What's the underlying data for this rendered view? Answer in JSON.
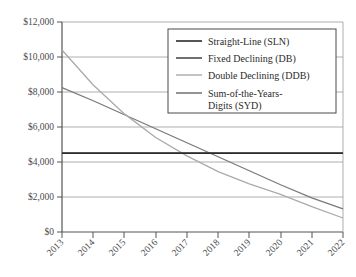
{
  "chart_data": {
    "type": "line",
    "title": "",
    "xlabel": "",
    "ylabel": "",
    "grid": true,
    "legend_position": "top-right",
    "x": [
      2013,
      2014,
      2015,
      2016,
      2017,
      2018,
      2019,
      2020,
      2021,
      2022
    ],
    "categories": [
      "2013",
      "2014",
      "2015",
      "2016",
      "2017",
      "2018",
      "2019",
      "2020",
      "2021",
      "2022"
    ],
    "ylim": [
      0,
      12000
    ],
    "ytick_values": [
      0,
      2000,
      4000,
      6000,
      8000,
      10000,
      12000
    ],
    "ytick_labels": [
      "$0",
      "$2,000",
      "$4,000",
      "$6,000",
      "$8,000",
      "$10,000",
      "$12,000"
    ],
    "series": [
      {
        "name": "Straight-Line (SLN)",
        "color": "#2b2b2b",
        "values": [
          4500,
          4500,
          4500,
          4500,
          4500,
          4500,
          4500,
          4500,
          4500,
          4500
        ]
      },
      {
        "name": "Fixed Declining (DB)",
        "color": "#4d4d4d",
        "values": [
          4520,
          4520,
          4520,
          4520,
          4520,
          4520,
          4520,
          4520,
          4520,
          4520
        ]
      },
      {
        "name": "Double Declining (DDB)",
        "color": "#aaaaaa",
        "values": [
          10400,
          8400,
          6750,
          5400,
          4350,
          3450,
          2750,
          2150,
          1450,
          800
        ]
      },
      {
        "name": "Sum-of-the-Years-Digits (SYD)",
        "color": "#7a7a7a",
        "values": [
          8250,
          7500,
          6700,
          5900,
          5100,
          4300,
          3500,
          2700,
          1950,
          1320
        ]
      }
    ]
  },
  "legend": {
    "items": [
      {
        "label": "Straight-Line (SLN)",
        "color": "#2b2b2b"
      },
      {
        "label": "Fixed Declining (DB)",
        "color": "#4d4d4d"
      },
      {
        "label": "Double Declining (DDB)",
        "color": "#b4b4b4"
      },
      {
        "label": "Sum-of-the-Years-",
        "color": "#7a7a7a"
      },
      {
        "label": "Digits (SYD)",
        "color": ""
      }
    ]
  },
  "axes": {
    "y_labels": [
      "$12,000",
      "$10,000",
      "$8,000",
      "$6,000",
      "$4,000",
      "$2,000",
      "$0"
    ],
    "x_labels": [
      "2013",
      "2014",
      "2015",
      "2016",
      "2017",
      "2018",
      "2019",
      "2020",
      "2021",
      "2022"
    ]
  }
}
